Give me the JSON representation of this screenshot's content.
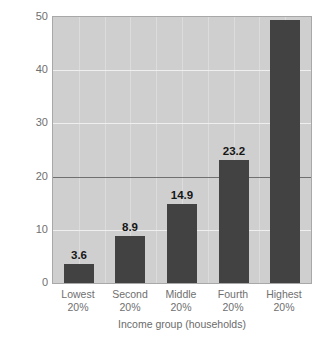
{
  "chart_data": {
    "type": "bar",
    "title": "",
    "categories": [
      "Lowest 20%",
      "Second 20%",
      "Middle 20%",
      "Fourth 20%",
      "Highest 20%"
    ],
    "category_lines": [
      [
        "Lowest",
        "20%"
      ],
      [
        "Second",
        "20%"
      ],
      [
        "Middle",
        "20%"
      ],
      [
        "Fourth",
        "20%"
      ],
      [
        "Highest",
        "20%"
      ]
    ],
    "values": [
      3.6,
      8.9,
      14.9,
      23.2,
      49.4
    ],
    "value_labels": [
      "3.6",
      "8.9",
      "14.9",
      "23.2",
      "49.4"
    ],
    "xlabel": "Income group (households)",
    "ylabel": "Personal income received (percent)",
    "ylim": [
      0,
      50
    ],
    "yticks": [
      0,
      10,
      20,
      30,
      40,
      50
    ],
    "ytick_labels": [
      "0",
      "10",
      "20",
      "30",
      "40",
      "50"
    ],
    "emphasized_gridline": 20,
    "grid": true,
    "legend": "none",
    "colors": {
      "bar": "#424242",
      "plot_background": "#cfcfcf",
      "gridline": "#efefef",
      "gridline_emphasis": "#707070",
      "axis_text": "#6f6f6f",
      "value_label": "#161616",
      "page_background": "#ffffff"
    }
  }
}
